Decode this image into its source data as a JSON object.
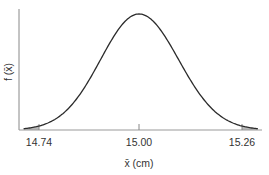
{
  "chart_data": {
    "type": "line",
    "title": "",
    "xlabel": "x̄ (cm)",
    "ylabel": "f (x̄)",
    "x_ticks": [
      {
        "value": 14.74,
        "label": "14.74"
      },
      {
        "value": 15.0,
        "label": "15.00"
      },
      {
        "value": 15.26,
        "label": "15.26"
      }
    ],
    "mean": 15.0,
    "std_dev": 0.1,
    "xlim": [
      14.7,
      15.3
    ],
    "shaded_regions": [
      {
        "from": 14.7,
        "to": 14.74,
        "side": "lower tail"
      },
      {
        "from": 15.26,
        "to": 15.3,
        "side": "upper tail"
      }
    ],
    "grid": false,
    "legend": null
  },
  "colors": {
    "curve": "#2b2b2b",
    "axis": "#888888",
    "shade": "#b8b8b8",
    "text": "#333333"
  }
}
